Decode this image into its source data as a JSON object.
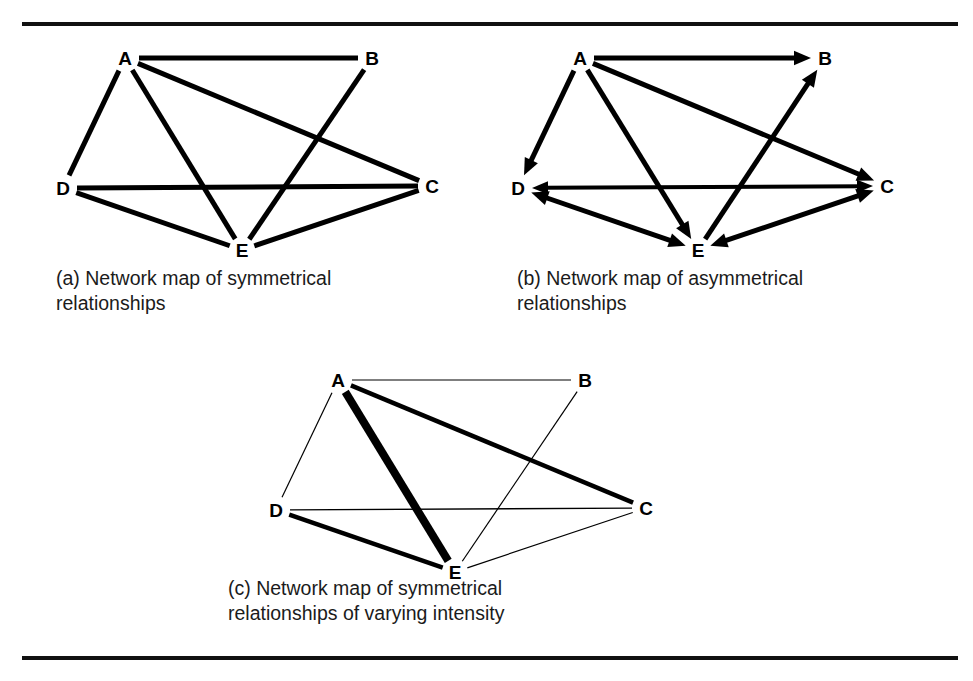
{
  "figure": {
    "background_color": "#ffffff",
    "ink_color": "#000000",
    "rule_color": "#111111",
    "top_rule": true,
    "bottom_rule": true
  },
  "chart_data": {
    "type": "diagram",
    "diagram_kind": "sociogram-network-map",
    "title": "",
    "node_names": [
      "A",
      "B",
      "C",
      "D",
      "E"
    ],
    "panels": [
      {
        "id": "a",
        "caption": "(a) Network map of symmetrical\nrelationships",
        "directed": false,
        "weighted": false,
        "nodes": [
          {
            "id": "A",
            "label": "A",
            "x": 107,
            "y": 22
          },
          {
            "id": "B",
            "label": "B",
            "x": 354,
            "y": 22
          },
          {
            "id": "C",
            "label": "C",
            "x": 414,
            "y": 150
          },
          {
            "id": "D",
            "label": "D",
            "x": 45,
            "y": 152
          },
          {
            "id": "E",
            "label": "E",
            "x": 224,
            "y": 214
          }
        ],
        "edges": [
          {
            "from": "A",
            "to": "B",
            "width": 5
          },
          {
            "from": "A",
            "to": "D",
            "width": 5
          },
          {
            "from": "A",
            "to": "E",
            "width": 5
          },
          {
            "from": "A",
            "to": "C",
            "width": 5
          },
          {
            "from": "D",
            "to": "C",
            "width": 5
          },
          {
            "from": "D",
            "to": "E",
            "width": 5
          },
          {
            "from": "E",
            "to": "C",
            "width": 5
          },
          {
            "from": "B",
            "to": "E",
            "width": 5
          }
        ]
      },
      {
        "id": "b",
        "caption": "(b) Network map of asymmetrical\nrelationships",
        "directed": true,
        "weighted": false,
        "nodes": [
          {
            "id": "A",
            "label": "A",
            "x": 85,
            "y": 22
          },
          {
            "id": "B",
            "label": "B",
            "x": 330,
            "y": 22
          },
          {
            "id": "C",
            "label": "C",
            "x": 392,
            "y": 150
          },
          {
            "id": "D",
            "label": "D",
            "x": 23,
            "y": 152
          },
          {
            "id": "E",
            "label": "E",
            "x": 203,
            "y": 214
          }
        ],
        "edges": [
          {
            "from": "A",
            "to": "B",
            "width": 5,
            "arrow": "end"
          },
          {
            "from": "A",
            "to": "D",
            "width": 5,
            "arrow": "end"
          },
          {
            "from": "A",
            "to": "E",
            "width": 5,
            "arrow": "end"
          },
          {
            "from": "A",
            "to": "C",
            "width": 5,
            "arrow": "end"
          },
          {
            "from": "D",
            "to": "C",
            "width": 4,
            "arrow": "both"
          },
          {
            "from": "D",
            "to": "E",
            "width": 5,
            "arrow": "both"
          },
          {
            "from": "C",
            "to": "E",
            "width": 5,
            "arrow": "both"
          },
          {
            "from": "E",
            "to": "B",
            "width": 5,
            "arrow": "end"
          }
        ]
      },
      {
        "id": "c",
        "caption": "(c) Network map of symmetrical\nrelationships of varying intensity",
        "directed": false,
        "weighted": true,
        "nodes": [
          {
            "id": "A",
            "label": "A",
            "x": 128,
            "y": 22
          },
          {
            "id": "B",
            "label": "B",
            "x": 375,
            "y": 22
          },
          {
            "id": "C",
            "label": "C",
            "x": 436,
            "y": 150
          },
          {
            "id": "D",
            "label": "D",
            "x": 66,
            "y": 152
          },
          {
            "id": "E",
            "label": "E",
            "x": 245,
            "y": 214
          }
        ],
        "edges": [
          {
            "from": "A",
            "to": "B",
            "width": 1.2,
            "intensity": "weak"
          },
          {
            "from": "A",
            "to": "D",
            "width": 1.2,
            "intensity": "weak"
          },
          {
            "from": "A",
            "to": "E",
            "width": 8,
            "intensity": "very strong"
          },
          {
            "from": "A",
            "to": "C",
            "width": 4.5,
            "intensity": "moderate"
          },
          {
            "from": "D",
            "to": "C",
            "width": 1.4,
            "intensity": "weak"
          },
          {
            "from": "D",
            "to": "E",
            "width": 4.5,
            "intensity": "moderate"
          },
          {
            "from": "E",
            "to": "C",
            "width": 1.2,
            "intensity": "weak"
          },
          {
            "from": "B",
            "to": "E",
            "width": 1.2,
            "intensity": "weak"
          }
        ]
      }
    ]
  },
  "panel_a": {
    "caption": "(a) Network map of symmetrical\nrelationships",
    "nodes": {
      "A": "A",
      "B": "B",
      "C": "C",
      "D": "D",
      "E": "E"
    }
  },
  "panel_b": {
    "caption": "(b) Network map of asymmetrical\nrelationships",
    "nodes": {
      "A": "A",
      "B": "B",
      "C": "C",
      "D": "D",
      "E": "E"
    }
  },
  "panel_c": {
    "caption": "(c) Network map of symmetrical\nrelationships of varying intensity",
    "nodes": {
      "A": "A",
      "B": "B",
      "C": "C",
      "D": "D",
      "E": "E"
    }
  }
}
